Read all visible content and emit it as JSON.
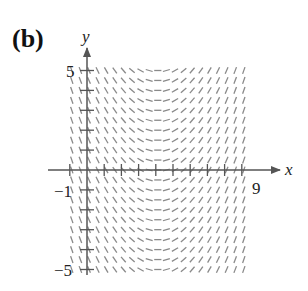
{
  "panel_label": "(b)",
  "axes": {
    "x_label": "x",
    "y_label": "y",
    "tick_labels": {
      "x_min": "−1",
      "x_max": "9",
      "y_max": "5",
      "y_min": "−5"
    }
  },
  "colors": {
    "axis": "#555555",
    "segments": "#8a8a8a",
    "text": "#222222"
  },
  "chart_data": {
    "type": "slope_field",
    "title": "(b)",
    "xlabel": "x",
    "ylabel": "y",
    "xlim": [
      -1,
      9
    ],
    "ylim": [
      -5,
      5
    ],
    "x_ticks": [
      -1,
      0,
      1,
      2,
      3,
      4,
      5,
      6,
      7,
      8,
      9
    ],
    "y_ticks": [
      -5,
      -4,
      -3,
      -2,
      -1,
      0,
      1,
      2,
      3,
      4,
      5
    ],
    "labeled_ticks": {
      "x": [
        -1,
        9
      ],
      "y": [
        -5,
        5
      ]
    },
    "grid_step": 0.5,
    "slope_description": "slope depends on x only; steep negative near x=-1, zero near x=4, steep positive near x=9",
    "slope_model": "dy/dx = 0.5*(x-4)",
    "grid": false
  }
}
